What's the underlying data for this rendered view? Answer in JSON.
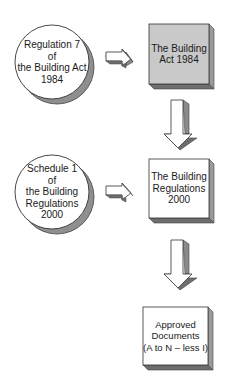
{
  "diagram": {
    "circles": [
      {
        "id": "regulation-7",
        "text": "Regulation 7\nof\nthe Building Act\n1984"
      },
      {
        "id": "schedule-1",
        "text": "Schedule 1\nof\nthe Building\nRegulations\n2000"
      }
    ],
    "boxes": [
      {
        "id": "building-act",
        "text": "The Building\nAct 1984",
        "fill": "#c9c9c9"
      },
      {
        "id": "building-regulations",
        "text": "The Building\nRegulations\n2000",
        "fill": "#ffffff"
      },
      {
        "id": "approved-documents",
        "text": "Approved\nDocuments\n(A to N – less I)",
        "fill": "#ffffff"
      }
    ],
    "arrows": [
      {
        "from": "regulation-7",
        "to": "building-act",
        "direction": "right"
      },
      {
        "from": "building-act",
        "to": "building-regulations",
        "direction": "down"
      },
      {
        "from": "schedule-1",
        "to": "building-regulations",
        "direction": "right"
      },
      {
        "from": "building-regulations",
        "to": "approved-documents",
        "direction": "down"
      }
    ],
    "colors": {
      "outline": "#333333",
      "shadow": "#8a8a8a",
      "side": "#9a9a9a",
      "bottom": "#6e6e6e"
    }
  }
}
